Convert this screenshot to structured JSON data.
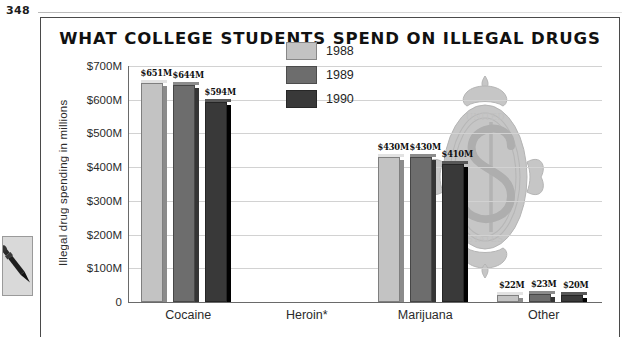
{
  "page": {
    "number": "348",
    "margin_icon": "pen-nib-icon"
  },
  "chart_data": {
    "type": "bar",
    "title": "WHAT COLLEGE STUDENTS SPEND ON ILLEGAL DRUGS",
    "xlabel": "",
    "ylabel": "Illegal drug spending in millions",
    "categories": [
      "Cocaine",
      "Heroin*",
      "Marijuana",
      "Other"
    ],
    "ylim": [
      0,
      700
    ],
    "yticks": [
      "0",
      "$100M",
      "$200M",
      "$300M",
      "$400M",
      "$500M",
      "$600M",
      "$700M"
    ],
    "ytick_values": [
      0,
      100,
      200,
      300,
      400,
      500,
      600,
      700
    ],
    "grid": true,
    "legend_position": "inside-top-center",
    "series": [
      {
        "name": "1988",
        "color": "#c3c3c3",
        "values": [
          651,
          null,
          430,
          22
        ],
        "labels": [
          "$651M",
          "",
          "$430M",
          "$22M"
        ]
      },
      {
        "name": "1989",
        "color": "#6d6d6d",
        "values": [
          644,
          null,
          430,
          23
        ],
        "labels": [
          "$644M",
          "",
          "$430M",
          "$23M"
        ]
      },
      {
        "name": "1990",
        "color": "#393939",
        "values": [
          594,
          null,
          410,
          20
        ],
        "labels": [
          "$594M",
          "",
          "$410M",
          "$20M"
        ]
      }
    ],
    "annotations": [
      "Heroin* category has no reported bars"
    ],
    "watermark": "dollar-sign-ornament"
  }
}
